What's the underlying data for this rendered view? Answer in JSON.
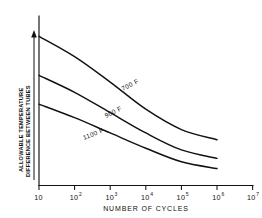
{
  "chart_data": {
    "type": "line",
    "title": "",
    "xlabel": "NUMBER OF CYCLES",
    "ylabel_line1": "ALLOWABLE TEMPERATURE",
    "ylabel_line2": "DIFFERENCE BETWEEN TUBES",
    "xscale": "log",
    "xlim": [
      10,
      10000000
    ],
    "xticks": [
      10,
      100,
      1000,
      10000,
      100000,
      1000000,
      10000000
    ],
    "xtick_labels": [
      "10",
      "10",
      "10",
      "10",
      "10",
      "10",
      "10"
    ],
    "xtick_exponents": [
      "",
      "2",
      "3",
      "4",
      "5",
      "6",
      "7"
    ],
    "ylim": [
      0,
      100
    ],
    "yticks": [],
    "ytick_labels": [],
    "grid": false,
    "legend_position": "inline-curve-labels",
    "y_axis_arrow": "upward",
    "series": [
      {
        "name": "700 F",
        "label": "700 F",
        "x": [
          10,
          100,
          1000,
          10000,
          100000,
          1000000
        ],
        "values": [
          88,
          76,
          61,
          45,
          33,
          27
        ]
      },
      {
        "name": "900 F",
        "label": "900 F",
        "x": [
          10,
          100,
          1000,
          10000,
          100000,
          1000000
        ],
        "values": [
          65,
          55,
          43,
          31,
          21,
          16
        ]
      },
      {
        "name": "1100 F",
        "label": "1100 F",
        "x": [
          10,
          100,
          1000,
          10000,
          100000,
          1000000
        ],
        "values": [
          48,
          40,
          31,
          22,
          14,
          10
        ]
      }
    ],
    "annotations": [
      {
        "text": "700 F",
        "series": "700 F",
        "rotation": -28
      },
      {
        "text": "900 F",
        "series": "900 F",
        "rotation": -26
      },
      {
        "text": "1100 F",
        "series": "1100 F",
        "rotation": -22
      }
    ],
    "colors": {
      "curve": "#111111",
      "axis": "#111111",
      "background": "#ffffff"
    }
  }
}
